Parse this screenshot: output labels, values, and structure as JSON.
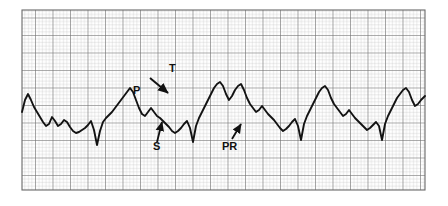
{
  "figure": {
    "kind": "ecg-rhythm-strip",
    "background_color": "#ffffff",
    "trace_color": "#121212",
    "grid": {
      "small_box_color": "#b9b9b9",
      "large_box_color": "#6e6e6e",
      "small_box_px": 3.5,
      "large_box_every": 5,
      "x0": 22,
      "y0": 10,
      "x1": 425,
      "y1": 190,
      "paper_speed_mm_per_s": 25,
      "gain_mm_per_mV": 10
    }
  },
  "annotations": [
    {
      "id": "p-wave",
      "label": "P",
      "x": 133,
      "y": 94,
      "arrow": false
    },
    {
      "id": "qrs-arrow",
      "label": "",
      "x": 0,
      "y": 0,
      "arrow": true,
      "arrow_from": [
        150,
        78
      ],
      "arrow_to": [
        168,
        93
      ]
    },
    {
      "id": "t-wave",
      "label": "T",
      "x": 169,
      "y": 72,
      "arrow": false
    },
    {
      "id": "s-wave",
      "label": "S",
      "x": 153,
      "y": 150,
      "arrow": true,
      "arrow_from": [
        157,
        142
      ],
      "arrow_to": [
        162,
        122
      ]
    },
    {
      "id": "pr-interval",
      "label": "PR",
      "x": 226,
      "y": 148,
      "arrow": true,
      "arrow_from": [
        232,
        139
      ],
      "arrow_to": [
        241,
        124
      ]
    }
  ],
  "chart_data": {
    "type": "line",
    "title": "",
    "xlabel": "",
    "ylabel": "",
    "grid": true,
    "legend": null,
    "x": [
      22,
      25,
      28,
      31,
      34,
      37,
      40,
      43,
      46,
      49,
      52,
      55,
      58,
      61,
      64,
      67,
      70,
      73,
      76,
      79,
      82,
      85,
      88,
      91,
      94,
      97,
      100,
      103,
      106,
      109,
      112,
      115,
      118,
      121,
      124,
      127,
      130,
      133,
      136,
      139,
      142,
      145,
      148,
      151,
      154,
      157,
      160,
      163,
      166,
      169,
      172,
      175,
      178,
      181,
      184,
      187,
      190,
      193,
      196,
      199,
      202,
      205,
      208,
      211,
      214,
      217,
      220,
      223,
      226,
      229,
      232,
      235,
      238,
      241,
      244,
      247,
      250,
      253,
      256,
      259,
      262,
      265,
      268,
      271,
      274,
      277,
      280,
      283,
      286,
      289,
      292,
      295,
      298,
      301,
      304,
      307,
      310,
      313,
      316,
      319,
      322,
      325,
      328,
      331,
      334,
      337,
      340,
      343,
      346,
      349,
      352,
      355,
      358,
      361,
      364,
      367,
      370,
      373,
      376,
      379,
      382,
      385,
      388,
      391,
      394,
      397,
      400,
      403,
      406,
      409,
      412,
      415,
      418,
      421,
      425
    ],
    "y": [
      112,
      100,
      94,
      100,
      107,
      112,
      117,
      122,
      126,
      124,
      117,
      121,
      126,
      124,
      120,
      122,
      127,
      131,
      133,
      132,
      130,
      128,
      125,
      121,
      130,
      145,
      131,
      122,
      118,
      115,
      112,
      108,
      104,
      100,
      96,
      92,
      88,
      92,
      100,
      108,
      114,
      116,
      112,
      108,
      112,
      116,
      118,
      121,
      124,
      127,
      131,
      133,
      131,
      128,
      124,
      121,
      128,
      142,
      126,
      118,
      112,
      106,
      100,
      94,
      88,
      84,
      82,
      86,
      94,
      100,
      96,
      90,
      86,
      84,
      90,
      98,
      104,
      108,
      112,
      110,
      106,
      110,
      114,
      117,
      120,
      124,
      128,
      131,
      129,
      126,
      122,
      119,
      126,
      140,
      124,
      116,
      110,
      104,
      98,
      92,
      88,
      86,
      90,
      98,
      104,
      108,
      112,
      116,
      114,
      110,
      114,
      118,
      121,
      124,
      127,
      130,
      128,
      125,
      122,
      126,
      140,
      124,
      116,
      110,
      104,
      98,
      94,
      90,
      88,
      92,
      100,
      106,
      104,
      100,
      96
    ],
    "ylim_px": [
      10,
      190
    ],
    "xlim_px": [
      22,
      425
    ]
  }
}
